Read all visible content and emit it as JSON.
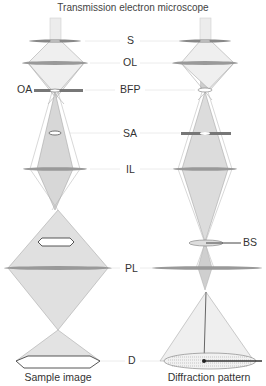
{
  "title": "Transmission electron microscope",
  "labels": {
    "s": "S",
    "ol": "OL",
    "bfp": "BFP",
    "oa": "OA",
    "sa": "SA",
    "il": "IL",
    "bs": "BS",
    "pl": "PL",
    "d": "D"
  },
  "captions": {
    "left": "Sample image",
    "right": "Diffraction pattern"
  },
  "colors": {
    "beam_fill": "#d9d9d9",
    "beam_core": "#bfbfbf",
    "lens": "#8c8c8c",
    "ray": "#9a9a9a",
    "guide_line": "#e6e6e6"
  }
}
